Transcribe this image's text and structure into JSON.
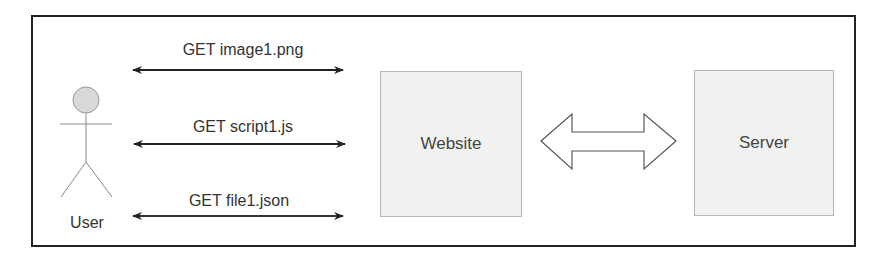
{
  "diagram": {
    "actor": {
      "label": "User"
    },
    "requests": [
      {
        "label": "GET image1.png"
      },
      {
        "label": "GET script1.js"
      },
      {
        "label": "GET file1.json"
      }
    ],
    "nodes": {
      "website": {
        "label": "Website"
      },
      "server": {
        "label": "Server"
      }
    },
    "connection": {
      "from": "Website",
      "to": "Server",
      "type": "bidirectional-block-arrow"
    }
  }
}
